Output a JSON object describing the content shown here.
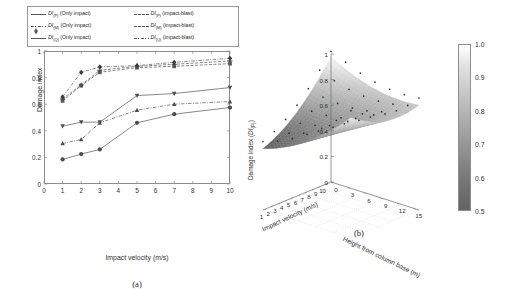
{
  "figure": {
    "panel_a_caption": "(a)",
    "panel_b_caption": "(b)"
  },
  "legend": {
    "items": [
      {
        "label_pre": "DI",
        "sub": "(P)",
        "label_post": " (Only impact)",
        "marker": "circle",
        "line": "solid"
      },
      {
        "label_pre": "DI",
        "sub": "(P)",
        "label_post": " (impact-blast)",
        "marker": "square",
        "line": "dash"
      },
      {
        "label_pre": "DI",
        "sub": "(M)",
        "label_post": " (Only impact)",
        "marker": "tri-up",
        "line": "dashdot"
      },
      {
        "label_pre": "DI",
        "sub": "(M)",
        "label_post": " (impact-blast)",
        "marker": "plus",
        "line": "dash"
      },
      {
        "label_pre": "DI",
        "sub": "(Q)",
        "label_post": " (Only impact)",
        "marker": "tri-dn",
        "line": "solid"
      },
      {
        "label_pre": "DI",
        "sub": "(Q)",
        "label_post": " (impact-blast)",
        "marker": "diamond",
        "line": "dashdot"
      }
    ]
  },
  "chart_data": [
    {
      "type": "line",
      "panel": "(a)",
      "title": "",
      "xlabel": "Impact velocity (m/s)",
      "ylabel": "Damage index",
      "xlim": [
        0,
        10
      ],
      "ylim": [
        0,
        1
      ],
      "xticks": [
        0,
        1,
        2,
        3,
        4,
        5,
        6,
        7,
        8,
        9,
        10
      ],
      "yticks": [
        0,
        0.2,
        0.4,
        0.6,
        0.8,
        1
      ],
      "ytick_labels": [
        "0",
        "0.2",
        "0.4",
        "0.6",
        "0.8",
        "1"
      ],
      "grid": false,
      "legend_position": "above-plot",
      "x": [
        1,
        2,
        3,
        5,
        7,
        10
      ],
      "series": [
        {
          "name": "DI(P) (Only impact)",
          "marker": "circle",
          "line": "solid",
          "values": [
            0.185,
            0.225,
            0.26,
            0.46,
            0.525,
            0.575
          ]
        },
        {
          "name": "DI(M) (Only impact)",
          "marker": "tri-up",
          "line": "dashdot",
          "values": [
            0.305,
            0.335,
            0.46,
            0.555,
            0.6,
            0.62
          ]
        },
        {
          "name": "DI(Q) (Only impact)",
          "marker": "tri-dn",
          "line": "solid",
          "values": [
            0.435,
            0.465,
            0.465,
            0.665,
            0.68,
            0.725
          ]
        },
        {
          "name": "DI(P) (impact-blast)",
          "marker": "square",
          "line": "dash",
          "values": [
            0.625,
            0.74,
            0.84,
            0.875,
            0.885,
            0.905
          ]
        },
        {
          "name": "DI(M) (impact-blast)",
          "marker": "plus",
          "line": "dash",
          "values": [
            0.64,
            0.745,
            0.855,
            0.885,
            0.9,
            0.925
          ]
        },
        {
          "name": "DI(Q) (impact-blast)",
          "marker": "diamond",
          "line": "dashdot",
          "values": [
            0.655,
            0.84,
            0.88,
            0.89,
            0.915,
            0.945
          ]
        }
      ]
    },
    {
      "type": "surface",
      "panel": "(b)",
      "title": "",
      "xlabel": "Impact velocity (m/s)",
      "ylabel": "Height from column base (m)",
      "zlabel_pre": "Damage index (",
      "zlabel_italic": "DI",
      "zlabel_sub": "(P)",
      "zlabel_post": ")",
      "zlabel": "Damage index (DI(P))",
      "xticks": [
        10,
        9,
        8,
        7,
        6,
        5,
        4,
        3,
        2,
        1
      ],
      "yticks": [
        0,
        3,
        6,
        9,
        12,
        15
      ],
      "zticks": [
        0,
        0.2,
        0.4,
        0.6,
        0.8,
        1
      ],
      "ztick_labels": [
        "0",
        "0.2",
        "0.4",
        "0.6",
        "0.8",
        "1"
      ],
      "zlim": [
        0,
        1
      ],
      "colorbar": {
        "min": 0.5,
        "max": 1.0,
        "ticks": [
          0.5,
          0.6,
          0.7,
          0.8,
          0.9,
          1.0
        ],
        "tick_labels": [
          "0.5",
          "0.6",
          "0.7",
          "0.8",
          "0.9",
          "1.0"
        ],
        "colormap": "grayscale",
        "low_color": "#636363",
        "high_color": "#ffffff"
      },
      "grid": true,
      "description": "Saddle-shaped damage-index surface; low values dip toward the front corner (low velocity, low height), high values along the rear and outer edges. Scatter markers show sampled data points above the fitted surface."
    }
  ]
}
